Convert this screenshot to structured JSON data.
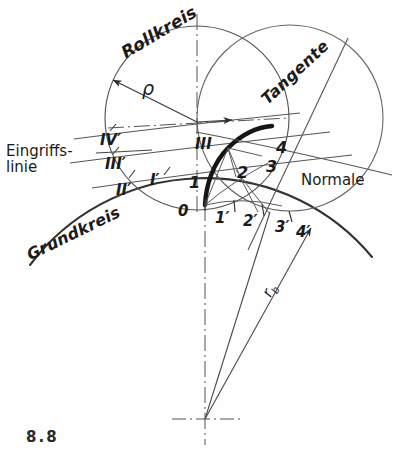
{
  "figure": {
    "title_fragment": "8.8",
    "background": "#fefefe",
    "ink": "#3a3a3a",
    "ink_dark": "#1b1b1b",
    "width": 413,
    "height": 450
  },
  "curve_labels": {
    "rollkreis": "Rollkreis",
    "grundkreis": "Grundkreis",
    "tangente": "Tangente",
    "normale": "Normale",
    "eingriffslinie_line1": "Eingriffs-",
    "eingriffslinie_line2": "linie"
  },
  "symbols": {
    "rho": "ρ",
    "rb": "r",
    "rb_sub": "b"
  },
  "roman_marks": [
    {
      "label": "I′",
      "x": 150,
      "y": 172
    },
    {
      "label": "II′",
      "x": 116,
      "y": 182
    },
    {
      "label": "III′",
      "x": 105,
      "y": 156
    },
    {
      "label": "IV′",
      "x": 100,
      "y": 132
    },
    {
      "label": "III",
      "x": 195,
      "y": 136
    }
  ],
  "arabic_marks": [
    {
      "label": "1",
      "x": 189,
      "y": 174
    },
    {
      "label": "2",
      "x": 237,
      "y": 164
    },
    {
      "label": "3",
      "x": 266,
      "y": 158
    },
    {
      "label": "4",
      "x": 276,
      "y": 139
    }
  ],
  "base_circle_marks": [
    {
      "label": "0",
      "x": 178,
      "y": 203
    },
    {
      "label": "1′",
      "x": 215,
      "y": 210
    },
    {
      "label": "2′",
      "x": 243,
      "y": 213
    },
    {
      "label": "3′",
      "x": 275,
      "y": 219
    },
    {
      "label": "4′",
      "x": 296,
      "y": 224
    }
  ],
  "chart_data": {
    "type": "diagram",
    "geometry": {
      "base_circle_center": [
        205,
        419
      ],
      "base_circle_radius": 218,
      "rolling_circle_center": [
        197,
        118
      ],
      "rolling_circle_radius": 92,
      "second_circle_center": [
        290,
        118
      ],
      "second_circle_radius": 93,
      "origin_point": [
        205,
        205
      ],
      "involute_start": [
        205,
        205
      ],
      "involute_end": [
        270,
        127
      ]
    }
  }
}
